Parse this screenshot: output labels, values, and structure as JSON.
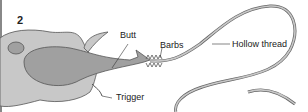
{
  "diagram": {
    "stage_number": "2",
    "labels": {
      "butt": "Butt",
      "barbs": "Barbs",
      "hollow_thread": "Hollow thread",
      "trigger": "Trigger"
    },
    "colors": {
      "cell_fill": "#c8c8c8",
      "capsule_fill": "#a0a0a0",
      "outline": "#555555",
      "border": "#888888"
    }
  }
}
